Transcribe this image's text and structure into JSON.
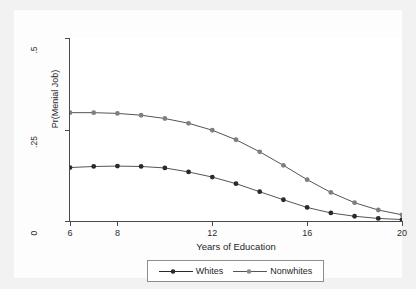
{
  "chart_data": {
    "type": "line",
    "title": "",
    "xlabel": "Years of Education",
    "ylabel": "Pr(Menial Job)",
    "xlim": [
      6,
      20
    ],
    "ylim": [
      0,
      0.5
    ],
    "xticks": [
      6,
      8,
      12,
      16,
      20
    ],
    "xtick_labels": [
      "6",
      "8",
      "12",
      "16",
      "20"
    ],
    "yticks": [
      0,
      0.25,
      0.5
    ],
    "ytick_labels": [
      "0",
      ".25",
      ".5"
    ],
    "grid": false,
    "legend_position": "bottom",
    "x": [
      6,
      7,
      8,
      9,
      10,
      11,
      12,
      13,
      14,
      15,
      16,
      17,
      18,
      19,
      20
    ],
    "series": [
      {
        "name": "Whites",
        "color": "#2a2a2a",
        "marker": "circle-filled",
        "values": [
          0.146,
          0.149,
          0.15,
          0.149,
          0.145,
          0.134,
          0.12,
          0.102,
          0.08,
          0.058,
          0.037,
          0.022,
          0.013,
          0.007,
          0.004
        ]
      },
      {
        "name": "Nonwhites",
        "color": "#7f7f7f",
        "marker": "circle-filled",
        "values": [
          0.296,
          0.296,
          0.294,
          0.289,
          0.28,
          0.267,
          0.248,
          0.222,
          0.189,
          0.152,
          0.113,
          0.078,
          0.05,
          0.03,
          0.017
        ]
      }
    ]
  },
  "legend": {
    "entries": [
      {
        "label": "Whites"
      },
      {
        "label": "Nonwhites"
      }
    ]
  },
  "colors": {
    "whites": "#2a2a2a",
    "nonwhites": "#7f7f7f",
    "axis": "#4a4a4a",
    "background": "#f2f2f2",
    "plot_background": "#ffffff"
  }
}
